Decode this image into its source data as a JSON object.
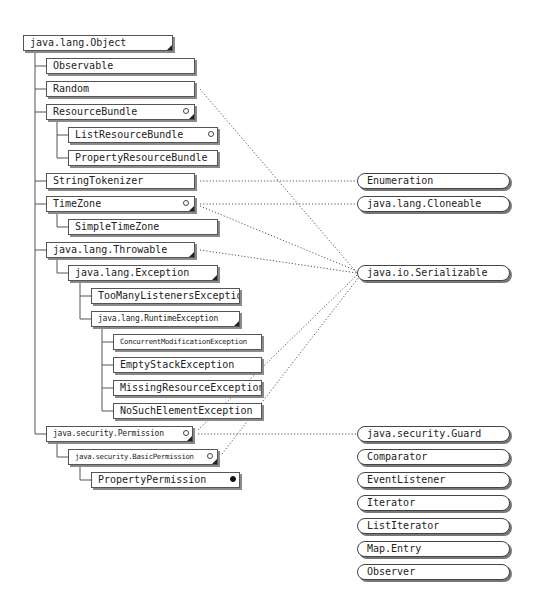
{
  "diagram": {
    "root": {
      "label": "java.lang.Object"
    },
    "classes": [
      {
        "id": "observable",
        "label": "Observable"
      },
      {
        "id": "random",
        "label": "Random"
      },
      {
        "id": "resourcebundle",
        "label": "ResourceBundle",
        "marker": "abstract"
      },
      {
        "id": "listresourcebundle",
        "label": "ListResourceBundle",
        "marker": "abstract"
      },
      {
        "id": "propertyresourcebundle",
        "label": "PropertyResourceBundle"
      },
      {
        "id": "stringtokenizer",
        "label": "StringTokenizer"
      },
      {
        "id": "timezone",
        "label": "TimeZone",
        "marker": "abstract"
      },
      {
        "id": "simpletimezone",
        "label": "SimpleTimeZone"
      },
      {
        "id": "throwable",
        "label": "java.lang.Throwable"
      },
      {
        "id": "exception",
        "label": "java.lang.Exception"
      },
      {
        "id": "toomanylisteners",
        "label": "TooManyListenersException"
      },
      {
        "id": "runtimeexception",
        "label": "java.lang.RuntimeException"
      },
      {
        "id": "concurrentmod",
        "label": "ConcurrentModificationException"
      },
      {
        "id": "emptystack",
        "label": "EmptyStackException"
      },
      {
        "id": "missingresource",
        "label": "MissingResourceException"
      },
      {
        "id": "nosuchelement",
        "label": "NoSuchElementException"
      },
      {
        "id": "permission",
        "label": "java.security.Permission",
        "marker": "abstract"
      },
      {
        "id": "basicpermission",
        "label": "java.security.BasicPermission",
        "marker": "abstract"
      },
      {
        "id": "propertypermission",
        "label": "PropertyPermission",
        "marker": "final"
      }
    ],
    "interfaces": [
      {
        "id": "enumeration",
        "label": "Enumeration"
      },
      {
        "id": "cloneable",
        "label": "java.lang.Cloneable"
      },
      {
        "id": "serializable",
        "label": "java.io.Serializable"
      },
      {
        "id": "guard",
        "label": "java.security.Guard"
      },
      {
        "id": "comparator",
        "label": "Comparator"
      },
      {
        "id": "eventlistener",
        "label": "EventListener"
      },
      {
        "id": "iterator",
        "label": "Iterator"
      },
      {
        "id": "listiterator",
        "label": "ListIterator"
      },
      {
        "id": "mapentry",
        "label": "Map.Entry"
      },
      {
        "id": "observer",
        "label": "Observer"
      }
    ],
    "implements": [
      {
        "from": "Random",
        "to": "java.io.Serializable"
      },
      {
        "from": "StringTokenizer",
        "to": "Enumeration"
      },
      {
        "from": "TimeZone",
        "to": "java.lang.Cloneable"
      },
      {
        "from": "TimeZone",
        "to": "java.io.Serializable"
      },
      {
        "from": "java.lang.Throwable",
        "to": "java.io.Serializable"
      },
      {
        "from": "java.security.Permission",
        "to": "java.security.Guard"
      },
      {
        "from": "java.security.Permission",
        "to": "java.io.Serializable"
      },
      {
        "from": "java.security.BasicPermission",
        "to": "java.io.Serializable"
      }
    ],
    "colors": {
      "line": "#555555",
      "shadow": "#8a8a8a",
      "background": "#ffffff"
    }
  }
}
